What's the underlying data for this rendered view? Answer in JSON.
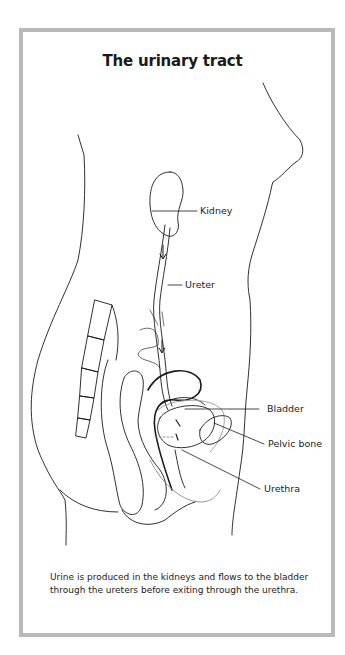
{
  "figure": {
    "title": "The urinary tract",
    "labels": {
      "kidney": "Kidney",
      "ureter": "Ureter",
      "bladder": "Bladder",
      "pelvic_bone": "Pelvic bone",
      "urethra": "Urethra"
    },
    "caption": "Urine is produced in the kidneys and flows to the bladder through the ureters before exiting through the urethra.",
    "colors": {
      "frame_border": "#b9b9b9",
      "line": "#1a1a1a",
      "shading": "#bdbdbd"
    }
  }
}
